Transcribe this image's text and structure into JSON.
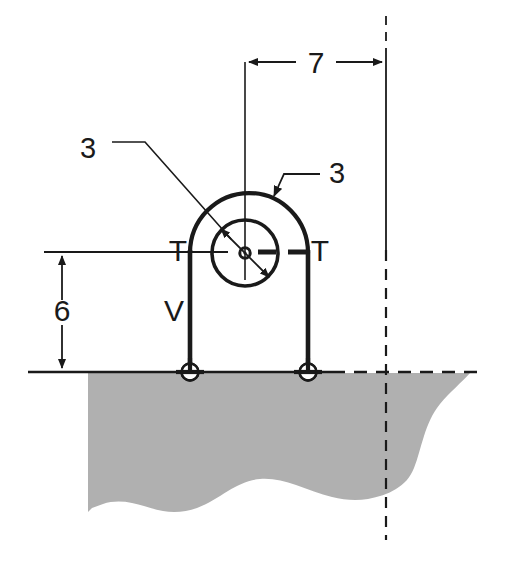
{
  "figure": {
    "type": "engineering-diagram",
    "background_color": "#ffffff",
    "line_color": "#1a1a1a",
    "ground_fill_color": "#b0b0b0"
  },
  "dimensions": {
    "horizontal": {
      "label": "7",
      "description": "horizontal distance from arch centerline to right reference line",
      "x_start": 245,
      "x_end": 386,
      "y": 62
    },
    "vertical": {
      "label": "6",
      "description": "height from ground line to arch centre / T-T axis",
      "x": 62,
      "y_start": 252,
      "y_end": 372
    }
  },
  "part_labels": [
    {
      "name": "radius-inner",
      "label": "3",
      "x": 88,
      "y": 148,
      "description": "inner circle radius label with leader to centre"
    },
    {
      "name": "radius-outer",
      "label": "3",
      "x": 337,
      "y": 172,
      "description": "outer arch radius label with leader to arch crown"
    }
  ],
  "node_labels": [
    {
      "name": "tension-left",
      "label": "T",
      "x": 178,
      "y": 252
    },
    {
      "name": "tension-right",
      "label": "T",
      "x": 318,
      "y": 252
    },
    {
      "name": "shear-left",
      "label": "V",
      "x": 176,
      "y": 310
    }
  ],
  "geometry": {
    "arch": {
      "center_x": 245,
      "center_y": 253,
      "outer_radius": 60,
      "inner_radius": 33,
      "crown_y": 193,
      "left_leg_x": 190,
      "right_leg_x": 308,
      "ground_y": 372
    },
    "supports": [
      {
        "name": "pin-support-left",
        "x": 190,
        "y": 372,
        "radius": 8
      },
      {
        "name": "pin-support-right",
        "x": 308,
        "y": 372,
        "radius": 8
      }
    ],
    "reference_line_x": 386,
    "axis_line_y": 252
  }
}
